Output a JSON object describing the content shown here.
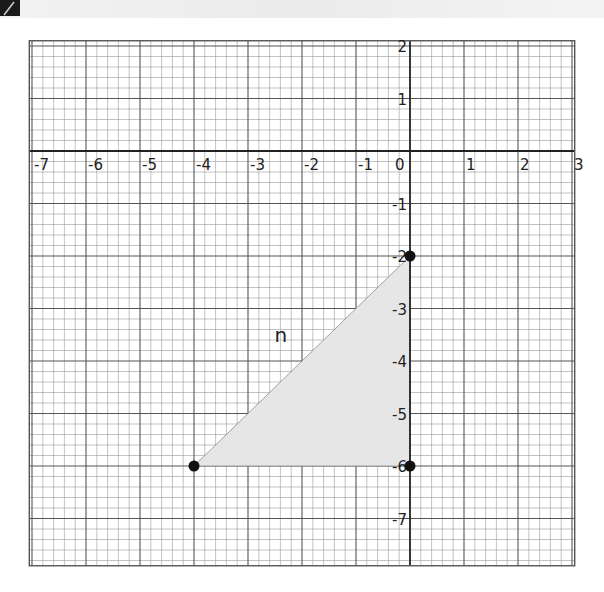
{
  "chart_data": {
    "type": "scatter",
    "title": "",
    "xlabel": "",
    "ylabel": "",
    "xlim": [
      -7.05,
      3.05
    ],
    "ylim": [
      -7.9,
      2.1
    ],
    "grid": true,
    "minor_subdivisions_per_unit": 5,
    "x_ticks": [
      -7,
      -6,
      -5,
      -4,
      -3,
      -2,
      -1,
      0,
      1,
      2,
      3
    ],
    "y_ticks": [
      2,
      1,
      -1,
      -2,
      -3,
      -4,
      -5,
      -6,
      -7
    ],
    "shapes": [
      {
        "name": "n",
        "kind": "triangle",
        "vertices": [
          [
            0,
            -2
          ],
          [
            0,
            -6
          ],
          [
            -4,
            -6
          ]
        ],
        "fill": "#e6e6e6",
        "label_position": [
          -2.4,
          -3.5
        ]
      }
    ],
    "points": [
      {
        "x": 0,
        "y": -2
      },
      {
        "x": 0,
        "y": -6
      },
      {
        "x": -4,
        "y": -6
      }
    ]
  },
  "labels": {
    "shape_name": "n",
    "x_tick_labels": [
      "-7",
      "-6",
      "-5",
      "-4",
      "-3",
      "-2",
      "-1",
      "0",
      "1",
      "2",
      "3"
    ],
    "y_tick_labels": [
      "2",
      "1",
      "-1",
      "-2",
      "-3",
      "-4",
      "-5",
      "-6",
      "-7"
    ]
  },
  "colors": {
    "grid_major": "#555555",
    "grid_minor": "#9a9a9a",
    "axis": "#222222",
    "triangle_fill": "#e6e6e6",
    "vertex": "#111111"
  }
}
